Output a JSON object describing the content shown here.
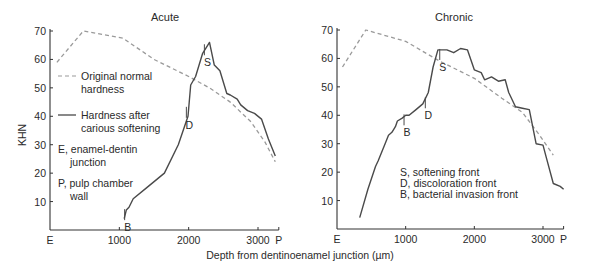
{
  "figure": {
    "xlabel": "Depth from dentinoenamel junction (µm)",
    "ylabel": "KHN"
  },
  "chart_data": [
    {
      "type": "line",
      "title": "Acute",
      "xlabel": "Depth from dentinoenamel junction (µm)",
      "ylabel": "KHN",
      "xlim": [
        0,
        3300
      ],
      "ylim": [
        0,
        70
      ],
      "x_ticks": [
        {
          "value": 0,
          "label": "E"
        },
        {
          "value": 1000,
          "label": "1000"
        },
        {
          "value": 2000,
          "label": "2000"
        },
        {
          "value": 3000,
          "label": "3000"
        },
        {
          "value": 3300,
          "label": "P"
        }
      ],
      "y_ticks": [
        10,
        20,
        30,
        40,
        50,
        60,
        70
      ],
      "grid": false,
      "series": [
        {
          "name": "Original normal hardness",
          "style": "dashed",
          "color": "#9a9a9a",
          "x": [
            100,
            480,
            1050,
            1500,
            2000,
            2300,
            2600,
            2900,
            3100,
            3250
          ],
          "y": [
            59,
            70,
            67.5,
            60,
            54,
            50,
            45,
            38,
            31,
            24
          ]
        },
        {
          "name": "Hardness after carious softening",
          "style": "solid",
          "color": "#4a4a4a",
          "x": [
            1070,
            1100,
            1140,
            1200,
            1400,
            1650,
            1850,
            1990,
            2030,
            2100,
            2200,
            2300,
            2370,
            2450,
            2550,
            2600,
            2700,
            2750,
            2850,
            2950,
            3050,
            3150,
            3250
          ],
          "y": [
            4,
            7,
            8,
            11,
            15,
            20,
            30,
            40,
            51,
            54,
            62,
            66,
            58,
            56,
            48,
            47.5,
            46,
            44,
            42,
            41,
            39,
            32,
            26
          ]
        }
      ],
      "annotations": [
        {
          "label": "S",
          "x": 2270,
          "y": 59
        },
        {
          "label": "D",
          "x": 2010,
          "y": 37
        },
        {
          "label": "B",
          "x": 1120,
          "y": 1
        }
      ],
      "legend_items": [
        {
          "label_line1": "Original normal",
          "label_line2": "hardness",
          "style": "dashed"
        },
        {
          "label_line1": "Hardness after",
          "label_line2": "carious softening",
          "style": "solid"
        }
      ],
      "key_text": [
        {
          "line1": "E, enamel-dentin",
          "line2": "junction"
        },
        {
          "line1": "P, pulp chamber",
          "line2": "wall"
        }
      ]
    },
    {
      "type": "line",
      "title": "Chronic",
      "xlabel": "Depth from dentinoenamel junction (µm)",
      "ylabel": "KHN",
      "xlim": [
        0,
        3300
      ],
      "ylim": [
        0,
        70
      ],
      "x_ticks": [
        {
          "value": 0,
          "label": "E"
        },
        {
          "value": 1000,
          "label": "1000"
        },
        {
          "value": 2000,
          "label": "2000"
        },
        {
          "value": 3000,
          "label": "3000"
        },
        {
          "value": 3300,
          "label": "P"
        }
      ],
      "y_ticks": [
        10,
        20,
        30,
        40,
        50,
        60,
        70
      ],
      "grid": false,
      "series": [
        {
          "name": "Original normal hardness",
          "style": "dashed",
          "color": "#9a9a9a",
          "x": [
            80,
            420,
            1000,
            1500,
            2000,
            2400,
            2700,
            2950,
            3150
          ],
          "y": [
            57,
            70,
            66,
            59,
            53,
            46,
            41,
            33,
            26
          ]
        },
        {
          "name": "Hardness after carious softening",
          "style": "solid",
          "color": "#4a4a4a",
          "x": [
            330,
            450,
            560,
            600,
            700,
            750,
            800,
            850,
            880,
            950,
            1000,
            1050,
            1150,
            1250,
            1330,
            1400,
            1470,
            1520,
            1600,
            1700,
            1800,
            1900,
            2000,
            2100,
            2150,
            2250,
            2350,
            2450,
            2500,
            2600,
            2700,
            2800,
            2900,
            3000,
            3050,
            3150,
            3250,
            3300
          ],
          "y": [
            4,
            14,
            22,
            24,
            30,
            33,
            34,
            36,
            38,
            39,
            40,
            40,
            42,
            44,
            48,
            57,
            63,
            63,
            63,
            62,
            63.5,
            63,
            56,
            55,
            52.5,
            53.5,
            52,
            52.5,
            48,
            43,
            42.5,
            42,
            30,
            29.5,
            25,
            16,
            15,
            14
          ]
        }
      ],
      "annotations": [
        {
          "label": "S",
          "x": 1540,
          "y": 57
        },
        {
          "label": "D",
          "x": 1330,
          "y": 40
        },
        {
          "label": "B",
          "x": 1020,
          "y": 34
        }
      ],
      "key_text": [
        {
          "line1": "S, softening front"
        },
        {
          "line1": "D, discoloration front"
        },
        {
          "line1": "B, bacterial invasion front"
        }
      ]
    }
  ]
}
